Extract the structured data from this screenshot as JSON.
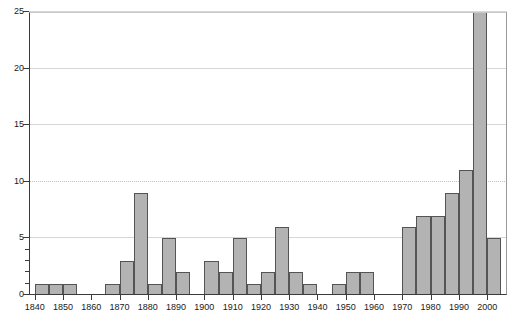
{
  "chart_data": {
    "type": "bar",
    "title": "",
    "subtitle": "",
    "xlabel": "",
    "ylabel": "",
    "xlim": [
      1838,
      2007
    ],
    "ylim": [
      0,
      25
    ],
    "grid": true,
    "legend": null,
    "bar_width_years": 5,
    "x_tick_labels": [
      "1840",
      "1850",
      "1860",
      "1870",
      "1880",
      "1890",
      "1900",
      "1910",
      "1920",
      "1930",
      "1940",
      "1950",
      "1960",
      "1970",
      "1980",
      "1990",
      "2000"
    ],
    "x_ticks": [
      1840,
      1850,
      1860,
      1870,
      1880,
      1890,
      1900,
      1910,
      1920,
      1930,
      1940,
      1950,
      1960,
      1970,
      1980,
      1990,
      2000
    ],
    "y_tick_labels": [
      "0",
      "5",
      "10",
      "15",
      "20",
      "25"
    ],
    "y_ticks": [
      0,
      5,
      10,
      15,
      20,
      25
    ],
    "y_minor_ticks": [
      1,
      2,
      3,
      4
    ],
    "categories": [
      1840,
      1845,
      1850,
      1855,
      1860,
      1865,
      1870,
      1875,
      1880,
      1885,
      1890,
      1895,
      1900,
      1905,
      1910,
      1915,
      1920,
      1925,
      1930,
      1935,
      1940,
      1945,
      1950,
      1955,
      1960,
      1965,
      1970,
      1975,
      1980,
      1985,
      1990,
      1995,
      2000
    ],
    "values": [
      1,
      1,
      1,
      0,
      0,
      1,
      3,
      9,
      1,
      5,
      2,
      0,
      3,
      2,
      5,
      1,
      2,
      6,
      2,
      1,
      0,
      1,
      2,
      2,
      0,
      0,
      6,
      7,
      7,
      9,
      11,
      25,
      5
    ],
    "colors": {
      "bar_fill": "#b3b3b3",
      "bar_border": "#545454",
      "axis": "#3b3b3b",
      "grid": "#d6d6d6",
      "text": "#1a1a1a",
      "background": "#ffffff"
    }
  }
}
